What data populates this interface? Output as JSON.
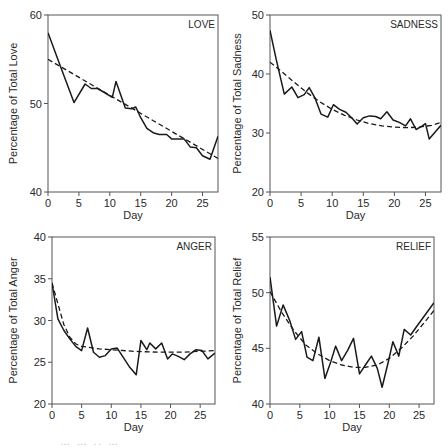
{
  "chart_data": [
    {
      "type": "line",
      "panel_label": "LOVE",
      "title": "",
      "xlabel": "Day",
      "ylabel": "Percentage of Total Love",
      "xlim": [
        0,
        27.5
      ],
      "ylim": [
        40,
        60
      ],
      "xticks": [
        0,
        5,
        10,
        15,
        20,
        25
      ],
      "yticks": [
        40,
        50,
        60
      ],
      "grid": false,
      "legend": null,
      "series": [
        {
          "name": "observed",
          "style": "solid",
          "x": [
            0,
            2,
            4.2,
            6,
            7,
            8,
            9,
            10.4,
            11,
            12.5,
            13.5,
            14.2,
            15,
            16,
            17,
            18,
            19.2,
            20,
            21,
            22,
            23,
            24,
            25,
            26.2,
            27.5
          ],
          "y": [
            58.0,
            54.2,
            50.1,
            52.2,
            51.7,
            51.7,
            51.3,
            50.7,
            52.5,
            49.5,
            49.4,
            49.6,
            48.4,
            47.2,
            46.7,
            46.5,
            46.5,
            46.0,
            46.0,
            46.0,
            45.1,
            45.0,
            44.1,
            43.7,
            46.3
          ]
        },
        {
          "name": "fitted",
          "style": "dashed",
          "x": [
            0,
            27.5
          ],
          "y": [
            55.0,
            43.8
          ]
        }
      ]
    },
    {
      "type": "line",
      "panel_label": "SADNESS",
      "title": "",
      "xlabel": "Day",
      "ylabel": "Percentage of Total Sadness",
      "xlim": [
        0,
        27.5
      ],
      "ylim": [
        20,
        50
      ],
      "xticks": [
        0,
        5,
        10,
        15,
        20,
        25
      ],
      "yticks": [
        20,
        30,
        40,
        50
      ],
      "grid": false,
      "legend": null,
      "series": [
        {
          "name": "observed",
          "style": "solid",
          "x": [
            0,
            1,
            2.3,
            3.5,
            4.5,
            5.5,
            6.3,
            7.2,
            8.2,
            9.3,
            10.2,
            11.2,
            12.2,
            13.2,
            14,
            15,
            16,
            17,
            17.8,
            18.8,
            19.8,
            20.8,
            21.8,
            22.6,
            23.5,
            24.5,
            25,
            25.6,
            26.6,
            27.5
          ],
          "y": [
            47.4,
            42.5,
            36.6,
            37.8,
            36.0,
            36.5,
            37.7,
            36.0,
            33.2,
            32.7,
            34.8,
            34.0,
            33.5,
            32.5,
            31.5,
            32.6,
            32.9,
            32.8,
            32.4,
            33.6,
            32.2,
            31.8,
            31.2,
            32.4,
            30.6,
            31.2,
            31.6,
            29.0,
            30.2,
            31.3
          ]
        },
        {
          "name": "fitted",
          "style": "dashed",
          "x": [
            0,
            2,
            4,
            6,
            8,
            10,
            12,
            14,
            16,
            18,
            20,
            22,
            24,
            26,
            27.5
          ],
          "y": [
            42.0,
            40.3,
            38.5,
            36.8,
            35.3,
            34.0,
            33.0,
            32.2,
            31.6,
            31.2,
            31.0,
            30.9,
            31.0,
            31.3,
            31.8
          ]
        }
      ]
    },
    {
      "type": "line",
      "panel_label": "ANGER",
      "title": "",
      "xlabel": "Day",
      "ylabel": "Percentage of Total Anger",
      "xlim": [
        0,
        27.5
      ],
      "ylim": [
        20,
        40
      ],
      "xticks": [
        0,
        5,
        10,
        15,
        20,
        25
      ],
      "yticks": [
        20,
        25,
        30,
        35,
        40
      ],
      "grid": false,
      "legend": null,
      "series": [
        {
          "name": "observed",
          "style": "solid",
          "x": [
            0,
            1,
            2,
            3,
            4,
            5,
            6,
            7,
            8,
            9,
            10,
            11,
            12,
            13,
            14.2,
            15,
            16,
            16.5,
            17.5,
            18.5,
            19.5,
            20.3,
            21.3,
            22.3,
            23.3,
            24.3,
            25.3,
            26.3,
            27.5
          ],
          "y": [
            34.5,
            30.2,
            28.8,
            27.8,
            26.9,
            26.4,
            29.1,
            26.2,
            25.6,
            25.8,
            26.6,
            26.7,
            25.6,
            24.5,
            23.5,
            27.6,
            26.5,
            27.3,
            26.6,
            27.3,
            25.4,
            26.0,
            25.7,
            25.3,
            26.0,
            26.5,
            26.4,
            25.4,
            26.1
          ]
        },
        {
          "name": "fitted",
          "style": "dashed",
          "x": [
            0,
            1,
            2,
            3,
            4,
            5,
            6,
            8,
            10,
            14,
            18,
            22,
            27.5
          ],
          "y": [
            34.5,
            32.0,
            29.5,
            28.0,
            27.2,
            26.9,
            26.8,
            26.6,
            26.5,
            26.3,
            26.2,
            26.2,
            26.4
          ]
        }
      ]
    },
    {
      "type": "line",
      "panel_label": "RELIEF",
      "title": "",
      "xlabel": "Day",
      "ylabel": "Percentage of Total Relief",
      "xlim": [
        0,
        27.5
      ],
      "ylim": [
        40,
        55
      ],
      "xticks": [
        0,
        5,
        10,
        15,
        20,
        25
      ],
      "yticks": [
        40,
        45,
        50,
        55
      ],
      "grid": false,
      "legend": null,
      "series": [
        {
          "name": "observed",
          "style": "solid",
          "x": [
            0,
            1.1,
            2.2,
            3.3,
            4.3,
            5.3,
            6.2,
            7.2,
            8.2,
            9.2,
            10.2,
            11,
            12,
            13,
            14,
            15,
            16,
            17,
            18,
            18.8,
            19.8,
            20.6,
            21.6,
            22.5,
            23.6,
            24.5,
            27.5
          ],
          "y": [
            51.4,
            47.0,
            48.9,
            47.5,
            45.8,
            46.5,
            44.2,
            43.9,
            46.0,
            42.3,
            43.8,
            45.2,
            43.9,
            44.8,
            45.9,
            42.7,
            43.5,
            44.3,
            43.2,
            41.5,
            43.7,
            45.6,
            44.3,
            46.7,
            46.2,
            46.9,
            49.1
          ]
        },
        {
          "name": "fitted",
          "style": "dashed",
          "x": [
            0,
            2,
            4,
            6,
            8,
            10,
            12,
            14,
            16,
            18,
            20,
            22,
            24,
            26,
            27.5
          ],
          "y": [
            50.1,
            48.2,
            46.6,
            45.3,
            44.5,
            43.9,
            43.5,
            43.3,
            43.3,
            43.5,
            44.1,
            45.0,
            46.1,
            47.4,
            48.4
          ]
        }
      ]
    }
  ],
  "caption_fragment": "… … .. …"
}
